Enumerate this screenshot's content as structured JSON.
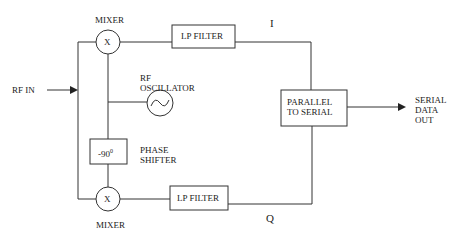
{
  "diagram": {
    "labels": {
      "mixer_top": "MIXER",
      "mixer_bottom": "MIXER",
      "mixer_symbol": "X",
      "lp_filter_top": "LP FILTER",
      "lp_filter_bottom": "LP FILTER",
      "rf_in": "RF IN",
      "rf_oscillator": "RF\nOSCILLATOR",
      "phase_shifter_value": "-90",
      "phase_shifter_sup": "0",
      "phase_shifter": "PHASE\nSHIFTER",
      "i_channel": "I",
      "q_channel": "Q",
      "parallel_to_serial": "PARALLEL\nTO SERIAL",
      "serial_data_out": "SERIAL\nDATA\nOUT"
    }
  }
}
